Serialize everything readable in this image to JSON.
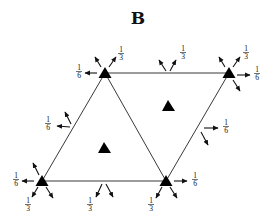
{
  "title": "B",
  "colors": {
    "ink": "#111111",
    "background": "#ffffff"
  },
  "vertices": [
    {
      "id": "top-left",
      "x": 105,
      "y": 73
    },
    {
      "id": "top-right",
      "x": 229,
      "y": 73
    },
    {
      "id": "bottom-left",
      "x": 42,
      "y": 181
    },
    {
      "id": "bottom-middle",
      "x": 166,
      "y": 181
    }
  ],
  "edges": [
    [
      "top-left",
      "top-right"
    ],
    [
      "top-left",
      "bottom-left"
    ],
    [
      "top-left",
      "bottom-middle"
    ],
    [
      "top-right",
      "bottom-middle"
    ],
    [
      "bottom-left",
      "bottom-middle"
    ]
  ],
  "inner_markers": [
    {
      "id": "left-face",
      "x": 104,
      "y": 148
    },
    {
      "id": "right-face",
      "x": 168,
      "y": 106
    }
  ],
  "labels": {
    "tl_outer": {
      "num": "1",
      "den": "6"
    },
    "tl_up": {
      "num": "1",
      "den": "3"
    },
    "tr_up": {
      "num": "1",
      "den": "3"
    },
    "tr_outer": {
      "num": "1",
      "den": "6"
    },
    "top_edge": {
      "num": "1",
      "den": "3"
    },
    "left_edge": {
      "num": "1",
      "den": "6"
    },
    "right_edge": {
      "num": "1",
      "den": "6"
    },
    "bl_outer": {
      "num": "1",
      "den": "6"
    },
    "bl_down": {
      "num": "1",
      "den": "3"
    },
    "bottom_edge": {
      "num": "1",
      "den": "3"
    },
    "bm_down": {
      "num": "1",
      "den": "3"
    },
    "bm_outer": {
      "num": "1",
      "den": "6"
    }
  }
}
